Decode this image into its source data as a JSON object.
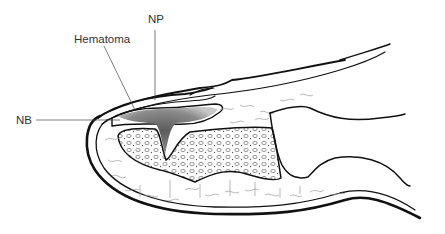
{
  "figure": {
    "labels": {
      "np": "NP",
      "hematoma": "Hematoma",
      "nb": "NB"
    }
  },
  "colors": {
    "ink": "#111111",
    "leader": "#444444",
    "tissue": "#9a9a9a",
    "hematoma": "#6b6b6b"
  }
}
